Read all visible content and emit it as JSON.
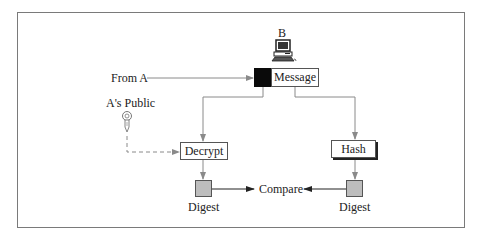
{
  "diagram": {
    "nodes": {
      "receiver": {
        "label": "B",
        "icon": "computer-icon"
      },
      "message": {
        "label": "Message"
      },
      "decrypt": {
        "label": "Decrypt"
      },
      "hash": {
        "label": "Hash"
      },
      "digest_left": {
        "label": "Digest"
      },
      "digest_right": {
        "label": "Digest"
      },
      "compare": {
        "label": "Compare"
      }
    },
    "inputs": {
      "from": {
        "label": "From A"
      },
      "key": {
        "label": "A's Public",
        "icon": "key-icon"
      }
    },
    "edges": [
      {
        "from": "From A",
        "to": "Message",
        "style": "solid"
      },
      {
        "from": "Message (signature)",
        "to": "Decrypt",
        "style": "solid"
      },
      {
        "from": "Message",
        "to": "Hash",
        "style": "solid"
      },
      {
        "from": "A's Public",
        "to": "Decrypt",
        "style": "dashed"
      },
      {
        "from": "Decrypt",
        "to": "Digest",
        "style": "solid"
      },
      {
        "from": "Hash",
        "to": "Digest",
        "style": "solid"
      },
      {
        "from": "Digest",
        "to": "Compare",
        "style": "solid"
      },
      {
        "from": "Digest",
        "to": "Compare",
        "style": "solid"
      }
    ],
    "colors": {
      "frame": "#7a7a7a",
      "line": "#8a8a8a",
      "arrow_dark": "#222222",
      "signature_block": "#0a0a0a",
      "digest_fill": "#bdbdbd"
    }
  }
}
